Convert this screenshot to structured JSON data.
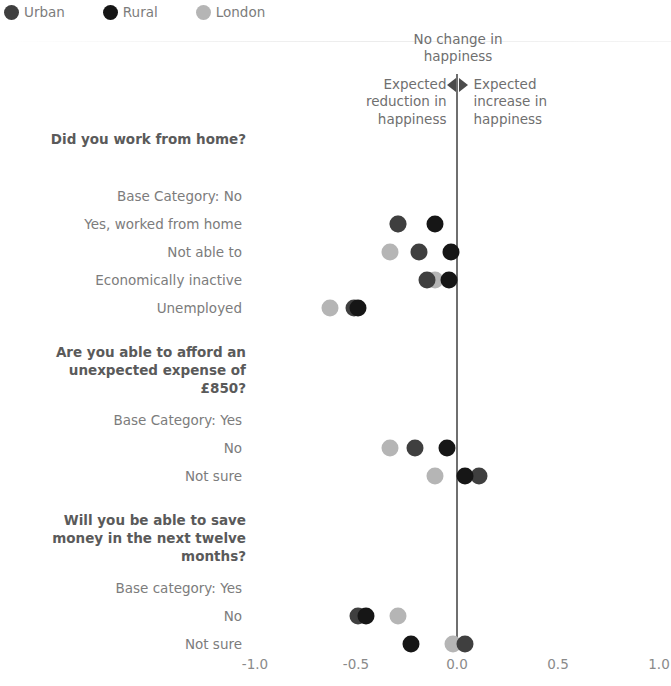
{
  "legend": {
    "items": [
      {
        "label": "Urban",
        "color": "#3f3f3f"
      },
      {
        "label": "Rural",
        "color": "#161616"
      },
      {
        "label": "London",
        "color": "#b5b5b5"
      }
    ]
  },
  "annotations": {
    "no_change": "No change in happiness",
    "left_label": "Expected reduction in happiness",
    "right_label": "Expected increase in happiness",
    "left_arrow_icon": "triangle-left-icon",
    "right_arrow_icon": "triangle-right-icon"
  },
  "axis": {
    "ticks": [
      "-1.0",
      "-0.5",
      "0.0",
      "0.5",
      "1.0"
    ],
    "tick_values": [
      -1.0,
      -0.5,
      0.0,
      0.5,
      1.0
    ],
    "xlim": [
      -1.05,
      1.05
    ]
  },
  "chart_data": {
    "type": "scatter",
    "title": "",
    "subtitle": "",
    "xlabel": "",
    "ylabel": "",
    "xlim": [
      -1.05,
      1.05
    ],
    "xticks": [
      -1.0,
      -0.5,
      0.0,
      0.5,
      1.0
    ],
    "grid": false,
    "legend_position": "top-left",
    "reference_line": 0.0,
    "series": [
      {
        "name": "Urban",
        "color": "#3f3f3f"
      },
      {
        "name": "Rural",
        "color": "#161616"
      },
      {
        "name": "London",
        "color": "#b5b5b5"
      }
    ],
    "sections": [
      {
        "title": "Did you work from home?",
        "base_category": "Base Category: No",
        "rows": [
          {
            "label": "Yes, worked from home",
            "values": {
              "Urban": -0.29,
              "Rural": -0.11,
              "London": -0.29
            }
          },
          {
            "label": "Not able to",
            "values": {
              "Urban": -0.19,
              "Rural": -0.03,
              "London": -0.33
            }
          },
          {
            "label": "Economically inactive",
            "values": {
              "Urban": -0.15,
              "Rural": -0.04,
              "London": -0.11
            }
          },
          {
            "label": "Unemployed",
            "values": {
              "Urban": -0.51,
              "Rural": -0.49,
              "London": -0.63
            }
          }
        ]
      },
      {
        "title": "Are you able to afford an unexpected expense of £850?",
        "base_category": "Base Category: Yes",
        "rows": [
          {
            "label": "No",
            "values": {
              "Urban": -0.21,
              "Rural": -0.05,
              "London": -0.33
            }
          },
          {
            "label": "Not sure",
            "values": {
              "Urban": 0.11,
              "Rural": 0.04,
              "London": -0.11
            }
          }
        ]
      },
      {
        "title": "Will you be able to save money in the next twelve months?",
        "base_category": "Base category: Yes",
        "rows": [
          {
            "label": "No",
            "values": {
              "Urban": -0.49,
              "Rural": -0.45,
              "London": -0.29
            }
          },
          {
            "label": "Not sure",
            "values": {
              "Urban": 0.04,
              "Rural": -0.23,
              "London": -0.02
            }
          }
        ]
      }
    ]
  }
}
